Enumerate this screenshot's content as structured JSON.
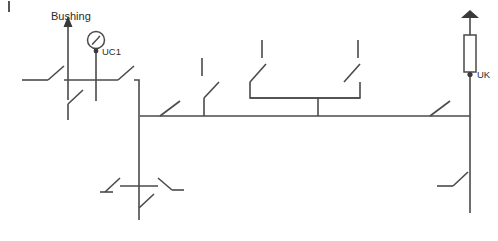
{
  "diagram": {
    "type": "electrical-single-line",
    "canvas": {
      "width": 498,
      "height": 241,
      "background": "#ffffff"
    },
    "stroke_color": "#4a4a4a",
    "text_color": "#2b2b2b",
    "labels": {
      "bushing": "Bushing",
      "uc1": "UC1",
      "uk": "UK"
    },
    "busbar": {
      "name": "main-busbar",
      "y": 116,
      "x_start": 140,
      "x_end": 470
    },
    "bays": [
      {
        "id": "bay-left-incomer",
        "label": "Bushing",
        "sensor_label": "UC1",
        "elements": [
          "bushing-arrow",
          "voltage-sensor-uc1",
          "upper-disconnector",
          "lower-disconnector"
        ]
      },
      {
        "id": "bay-left-breaker",
        "elements": [
          "disconnector",
          "riser",
          "busbar-disconnector"
        ]
      },
      {
        "id": "bay-center-left",
        "elements": [
          "open-disconnector",
          "riser"
        ]
      },
      {
        "id": "bay-center-coupler",
        "elements": [
          "open-disconnector-left",
          "open-disconnector-right",
          "tie-bar",
          "riser"
        ]
      },
      {
        "id": "bay-right-uk",
        "label": "UK",
        "elements": [
          "bushing-arrow-flat",
          "surge-arrester-block",
          "tap-point-uk",
          "riser",
          "busbar-disconnector",
          "lower-disconnector"
        ]
      },
      {
        "id": "bay-bottom-left",
        "elements": [
          "cross-node",
          "left-disconnector",
          "right-disconnector",
          "lower-disconnector"
        ]
      }
    ]
  }
}
